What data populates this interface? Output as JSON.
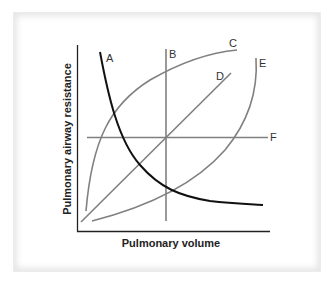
{
  "diagram": {
    "x_axis_label": "Pulmonary volume",
    "y_axis_label": "Pulmonary airway resistance",
    "curves": [
      {
        "id": "A",
        "label": "A",
        "color": "#111111",
        "description": "hyperbolic decreasing curve"
      },
      {
        "id": "B",
        "label": "B",
        "color": "#808080",
        "description": "vertical line"
      },
      {
        "id": "C",
        "label": "C",
        "color": "#808080",
        "description": "concave increasing curve"
      },
      {
        "id": "D",
        "label": "D",
        "color": "#808080",
        "description": "linear increasing line"
      },
      {
        "id": "E",
        "label": "E",
        "color": "#808080",
        "description": "convex increasing curve"
      },
      {
        "id": "F",
        "label": "F",
        "color": "#808080",
        "description": "horizontal line"
      }
    ]
  },
  "colors": {
    "axis": "#222222",
    "curve_gray": "#808080",
    "curve_dark": "#111111",
    "panel_shadow": "#e6e6e6"
  }
}
